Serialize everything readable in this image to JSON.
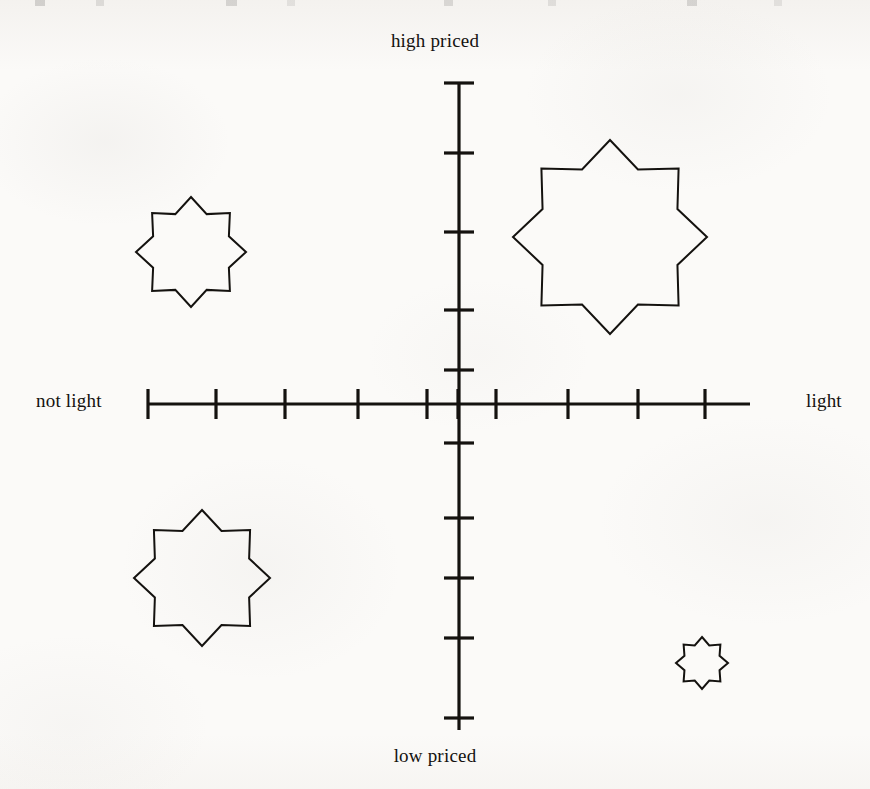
{
  "page": {
    "background_color": "#fbfaf8",
    "ink_color": "#14120f",
    "width": 870,
    "height": 789
  },
  "labels": {
    "top": "high priced",
    "bottom": "low priced",
    "left": "not light",
    "right": "light"
  },
  "chart_data": {
    "type": "scatter",
    "title": "",
    "xlabel": "",
    "ylabel": "",
    "x_axis": {
      "left_label": "not light",
      "right_label": "light",
      "center_px": 459,
      "line_start_px": 148,
      "line_end_px": 750,
      "tick_positions_px": [
        148,
        216,
        285,
        358,
        427,
        458,
        496,
        568,
        638,
        705
      ],
      "tick_count": 10,
      "xlim": [
        -5,
        5
      ]
    },
    "y_axis": {
      "top_label": "high priced",
      "bottom_label": "low priced",
      "center_px": 404,
      "line_start_px": 83,
      "line_end_px": 730,
      "tick_positions_px": [
        83,
        153,
        232,
        310,
        370,
        443,
        518,
        578,
        638,
        718
      ],
      "tick_count": 10,
      "ylim": [
        -5,
        5
      ]
    },
    "grid": false,
    "legend": null,
    "marker_shape": "eight-pointed-star",
    "points": [
      {
        "id": "brand-upper-left",
        "label": "",
        "quadrant": "not light / high priced",
        "cx_px": 191,
        "cy_px": 252,
        "outer_radius_px": 55,
        "inner_radius_px": 41,
        "x": -2.4,
        "y": 1.9,
        "size_rank": 3
      },
      {
        "id": "brand-upper-right",
        "label": "",
        "quadrant": "light / high priced",
        "cx_px": 610,
        "cy_px": 237,
        "outer_radius_px": 97,
        "inner_radius_px": 73,
        "x": 1.6,
        "y": 2.0,
        "size_rank": 1
      },
      {
        "id": "brand-lower-left",
        "label": "",
        "quadrant": "not light / low priced",
        "cx_px": 202,
        "cy_px": 578,
        "outer_radius_px": 68,
        "inner_radius_px": 51,
        "x": -2.3,
        "y": -1.9,
        "size_rank": 2
      },
      {
        "id": "brand-lower-right",
        "label": "",
        "quadrant": "light / low priced",
        "cx_px": 702,
        "cy_px": 663,
        "outer_radius_px": 26,
        "inner_radius_px": 19,
        "x": 3.1,
        "y": -3.0,
        "size_rank": 4
      }
    ]
  }
}
